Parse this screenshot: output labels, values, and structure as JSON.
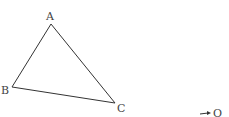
{
  "diagram": {
    "type": "triangle",
    "stroke_color": "#333333",
    "label_color": "#444444",
    "vertices": [
      {
        "label": "A",
        "x": 51,
        "y": 24,
        "lx": 46,
        "ly": 20
      },
      {
        "label": "B",
        "x": 12,
        "y": 87,
        "lx": 1,
        "ly": 94
      },
      {
        "label": "C",
        "x": 115,
        "y": 103,
        "lx": 117,
        "ly": 112
      }
    ],
    "point_o": {
      "label": "O",
      "lx": 213,
      "ly": 117,
      "arrow_from": [
        200,
        114
      ],
      "arrow_to": [
        211,
        113
      ]
    }
  }
}
